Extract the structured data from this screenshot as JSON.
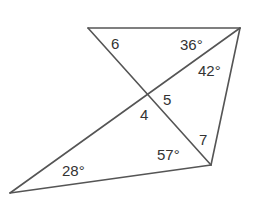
{
  "diagram": {
    "type": "geometry-figure",
    "stroke_color": "#555555",
    "text_color": "#333333",
    "vertices": {
      "A": [
        88,
        28
      ],
      "B": [
        240,
        28
      ],
      "C": [
        211,
        165
      ],
      "D": [
        10,
        193
      ],
      "X": [
        148,
        96
      ]
    },
    "segments": [
      [
        "A",
        "B"
      ],
      [
        "A",
        "C"
      ],
      [
        "B",
        "D"
      ],
      [
        "B",
        "C"
      ],
      [
        "C",
        "D"
      ]
    ],
    "labels": {
      "angle6": "6",
      "angle36": "36°",
      "angle42": "42°",
      "angle5": "5",
      "angle4": "4",
      "angle7": "7",
      "angle57": "57°",
      "angle28": "28°"
    }
  }
}
